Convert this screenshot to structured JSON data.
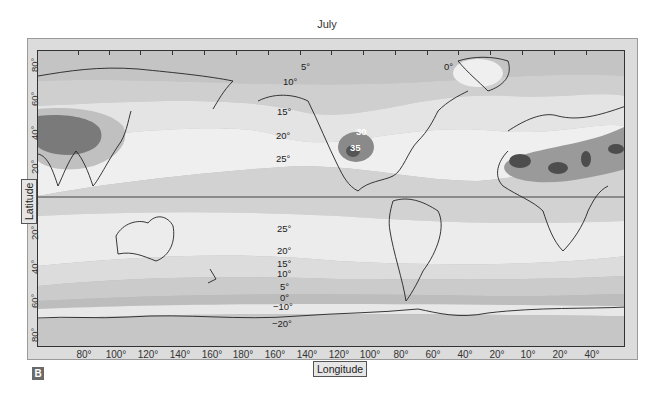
{
  "title": "July",
  "panel_badge": "B",
  "axes": {
    "x_label": "Longitude",
    "y_label": "Latitude",
    "x_ticks": [
      "80°",
      "100°",
      "120°",
      "140°",
      "160°",
      "180°",
      "160°",
      "140°",
      "120°",
      "100°",
      "80°",
      "60°",
      "40°",
      "20°",
      "10°",
      "20°",
      "40°"
    ],
    "y_ticks": [
      "80°",
      "60°",
      "40°",
      "20°",
      "0°",
      "20°",
      "40°",
      "60°",
      "80°"
    ]
  },
  "isotherm_labels": [
    {
      "text": "5°",
      "x": 301,
      "y": 66
    },
    {
      "text": "10°",
      "x": 283,
      "y": 80
    },
    {
      "text": "15°",
      "x": 277,
      "y": 110
    },
    {
      "text": "20°",
      "x": 276,
      "y": 134
    },
    {
      "text": "25°",
      "x": 276,
      "y": 157
    },
    {
      "text": "30",
      "x": 356,
      "y": 130,
      "white": true
    },
    {
      "text": "35",
      "x": 350,
      "y": 146,
      "white": true
    },
    {
      "text": "0°",
      "x": 444,
      "y": 65
    },
    {
      "text": "25°",
      "x": 277,
      "y": 224
    },
    {
      "text": "20°",
      "x": 277,
      "y": 246
    },
    {
      "text": "15°",
      "x": 277,
      "y": 262
    },
    {
      "text": "10°",
      "x": 277,
      "y": 272
    },
    {
      "text": "5°",
      "x": 280,
      "y": 285
    },
    {
      "text": "0°",
      "x": 280,
      "y": 296
    },
    {
      "text": "−10°",
      "x": 273,
      "y": 304
    },
    {
      "text": "−20°",
      "x": 272,
      "y": 321
    }
  ],
  "colors": {
    "band_coldest": "#b0b0b0",
    "band_cool": "#c8c8c8",
    "band_mild": "#dedede",
    "band_warm": "#ededed",
    "band_hot": "#c2c2c2",
    "band_very_hot": "#8f8f8f",
    "band_extreme": "#555555",
    "frame": "#dcdcdc",
    "coastline": "#222222"
  },
  "legend": "Isotherms of mean July air temperature (°C)"
}
